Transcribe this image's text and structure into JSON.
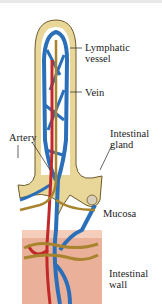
{
  "diagram": {
    "labels": {
      "lymphatic_vessel": [
        "Lymphatic",
        "vessel"
      ],
      "vein": "Vein",
      "artery": "Artery",
      "intestinal_gland": [
        "Intestinal",
        "gland"
      ],
      "mucosa": "Mucosa",
      "intestinal_wall": [
        "Intestinal",
        "wall"
      ]
    },
    "colors": {
      "epithelium": "#e9d79a",
      "epithelium_line": "#6b5a2a",
      "vein": "#2a6fb8",
      "artery": "#c0282a",
      "lymphatic": "#a8842e",
      "wall": "#e9a98c",
      "background": "#ffffff"
    }
  }
}
